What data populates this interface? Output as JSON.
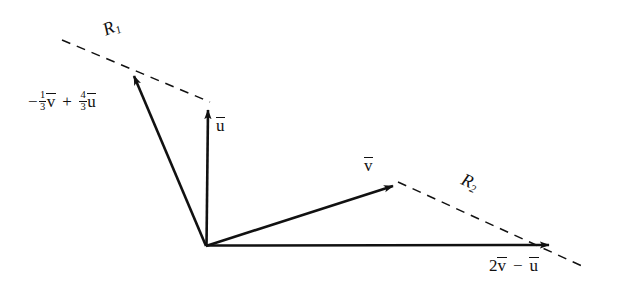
{
  "figure": {
    "type": "vector-diagram",
    "background_color": "#ffffff",
    "stroke_color": "#111111",
    "origin": {
      "x": 206,
      "y": 246
    },
    "vectors": [
      {
        "id": "u",
        "label": "u",
        "overline": true,
        "from": {
          "x": 206,
          "y": 246
        },
        "to": {
          "x": 208,
          "y": 103
        },
        "style": "solid-arrow",
        "label_pos": {
          "x": 216,
          "y": 116
        }
      },
      {
        "id": "v",
        "label": "v",
        "overline": true,
        "from": {
          "x": 206,
          "y": 246
        },
        "to": {
          "x": 400,
          "y": 183
        },
        "style": "solid-arrow",
        "label_pos": {
          "x": 364,
          "y": 156
        }
      },
      {
        "id": "combo-left",
        "label_parts": {
          "sign": "−",
          "coef1_num": "1",
          "coef1_den": "3",
          "var1": "v",
          "op": "+",
          "coef2_num": "4",
          "coef2_den": "3",
          "var2": "u"
        },
        "from": {
          "x": 206,
          "y": 246
        },
        "to": {
          "x": 131,
          "y": 69
        },
        "style": "solid-arrow",
        "label_pos": {
          "x": 28,
          "y": 90
        }
      },
      {
        "id": "combo-right",
        "label_parts": {
          "coef1": "2",
          "var1": "v",
          "op": "−",
          "var2": "u"
        },
        "from": {
          "x": 206,
          "y": 246
        },
        "to": {
          "x": 556,
          "y": 245
        },
        "style": "solid-arrow",
        "label_pos": {
          "x": 489,
          "y": 256
        }
      }
    ],
    "dashed_lines": [
      {
        "id": "R1",
        "label": "R",
        "subscript": "1",
        "from": {
          "x": 62,
          "y": 40
        },
        "to": {
          "x": 210,
          "y": 102
        },
        "label_pos": {
          "x": 100,
          "y": 22
        },
        "label_rotation_deg": -23
      },
      {
        "id": "R2",
        "label": "R",
        "subscript": "2",
        "from": {
          "x": 398,
          "y": 182
        },
        "to": {
          "x": 582,
          "y": 266
        },
        "label_pos": {
          "x": 466,
          "y": 170
        },
        "label_rotation_deg": 24
      }
    ]
  }
}
